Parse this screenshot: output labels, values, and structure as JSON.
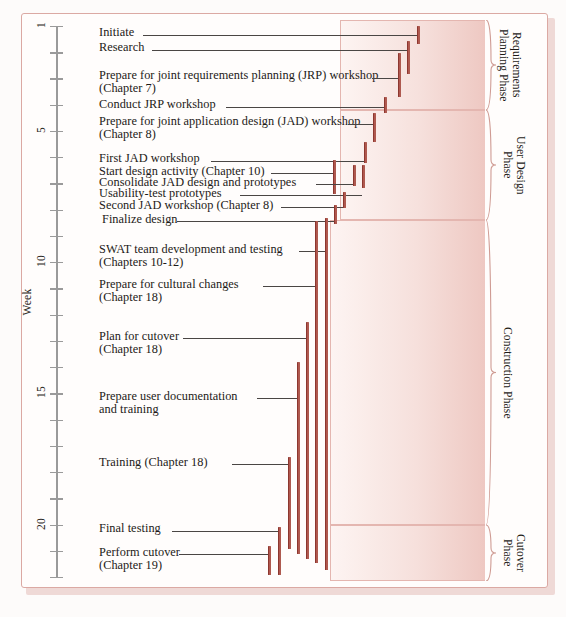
{
  "figure": {
    "axis_title": "Week",
    "axis_ticks": [
      1,
      2,
      3,
      4,
      5,
      6,
      7,
      8,
      9,
      10,
      11,
      12,
      13,
      14,
      15,
      16,
      17,
      18,
      19,
      20,
      21,
      22
    ],
    "axis_labeled_ticks": [
      1,
      5,
      10,
      15,
      20
    ],
    "colors": {
      "bar": "#8c352c",
      "frame_border": "#dba9a3",
      "phase_fill": "#f2d5d0",
      "axis": "#9a9a9a",
      "leader": "#4a4644",
      "text": "#1d1a17"
    }
  },
  "chart_data": {
    "type": "bar",
    "title": "",
    "xlabel": "",
    "ylabel": "Week",
    "ylim": [
      1,
      22
    ],
    "orientation": "vertical-duration-bars",
    "categories": [
      "Initiate",
      "Research",
      "Prepare for joint requirements planning (JRP) workshop (Chapter 7)",
      "Conduct JRP workshop",
      "Prepare for joint application design (JAD) workshop (Chapter 8)",
      "First JAD workshop",
      "Start design activity (Chapter 10)",
      "Consolidate JAD design and prototypes",
      "Usability-test prototypes",
      "Second JAD workshop (Chapter 8)",
      "Finalize design",
      "SWAT team development and testing (Chapters 10-12)",
      "Prepare for cultural changes (Chapter 18)",
      "Plan for cutover (Chapter 18)",
      "Prepare user documentation and training",
      "Training (Chapter 18)",
      "Final testing",
      "Perform cutover (Chapter 19)"
    ],
    "tasks": [
      {
        "id": "initiate",
        "label_line1": "Initiate",
        "label_line2": "",
        "start_week": 1.0,
        "end_week": 1.45,
        "bar_x": 417,
        "bar_top": 26,
        "bar_bottom": 44,
        "label_x": 99,
        "label_y": 26,
        "leader_x1": 143,
        "leader_x2": 417,
        "leader_y": 35
      },
      {
        "id": "research",
        "label_line1": "Research",
        "label_line2": "",
        "start_week": 1.3,
        "end_week": 2.6,
        "bar_x": 407,
        "bar_top": 41,
        "bar_bottom": 74,
        "label_x": 99,
        "label_y": 41,
        "leader_x1": 152,
        "leader_x2": 407,
        "leader_y": 50
      },
      {
        "id": "prepare-jrp",
        "label_line1": "Prepare for joint requirements planning (JRP) workshop",
        "label_line2": "(Chapter 7)",
        "start_week": 1.9,
        "end_week": 3.5,
        "bar_x": 398,
        "bar_top": 53,
        "bar_bottom": 97,
        "label_x": 99,
        "label_y": 69,
        "leader_x1": 372,
        "leader_x2": 398,
        "leader_y": 78
      },
      {
        "id": "conduct-jrp",
        "label_line1": "Conduct JRP workshop",
        "label_line2": "",
        "start_week": 3.5,
        "end_week": 4.1,
        "bar_x": 384,
        "bar_top": 97,
        "bar_bottom": 113,
        "label_x": 99,
        "label_y": 98,
        "leader_x1": 226,
        "leader_x2": 384,
        "leader_y": 107
      },
      {
        "id": "prepare-jad",
        "label_line1": "Prepare for joint application design (JAD) workshop",
        "label_line2": "(Chapter 8)",
        "start_week": 4.0,
        "end_week": 5.1,
        "bar_x": 373,
        "bar_top": 113,
        "bar_bottom": 142,
        "label_x": 99,
        "label_y": 115,
        "leader_x1": 348,
        "leader_x2": 373,
        "leader_y": 124
      },
      {
        "id": "first-jad",
        "label_line1": "First JAD workshop",
        "label_line2": "",
        "start_week": 5.1,
        "end_week": 5.9,
        "bar_x": 364,
        "bar_top": 142,
        "bar_bottom": 163,
        "label_x": 99,
        "label_y": 152,
        "leader_x1": 211,
        "leader_x2": 364,
        "leader_y": 161
      },
      {
        "id": "start-design",
        "label_line1": "Start design activity (Chapter 10)",
        "label_line2": "",
        "start_week": 5.8,
        "end_week": 7.1,
        "bar_x": 333,
        "bar_top": 160,
        "bar_bottom": 194,
        "label_x": 99,
        "label_y": 165,
        "leader_x1": 271,
        "leader_x2": 333,
        "leader_y": 173
      },
      {
        "id": "consolidate-jad",
        "label_line1": "Consolidate JAD design and prototypes",
        "label_line2": "",
        "start_week": 5.9,
        "end_week": 6.6,
        "bar_x": 353,
        "bar_top": 165,
        "bar_bottom": 186,
        "label_x": 99,
        "label_y": 176,
        "leader_x1": 316,
        "leader_x2": 353,
        "leader_y": 184
      },
      {
        "id": "usability-test",
        "label_line1": "Usability-test prototypes",
        "label_line2": "",
        "start_week": 5.9,
        "end_week": 6.7,
        "bar_x": 362,
        "bar_top": 165,
        "bar_bottom": 188,
        "label_x": 99,
        "label_y": 187,
        "leader_x1": 240,
        "leader_x2": 362,
        "leader_y": 195
      },
      {
        "id": "second-jad",
        "label_line1": "Second JAD workshop (Chapter 8)",
        "label_line2": "",
        "start_week": 6.7,
        "end_week": 7.3,
        "bar_x": 343,
        "bar_top": 192,
        "bar_bottom": 208,
        "label_x": 99,
        "label_y": 199,
        "leader_x1": 281,
        "leader_x2": 343,
        "leader_y": 207
      },
      {
        "id": "finalize-design",
        "label_line1": "Finalize design",
        "label_line2": "",
        "start_week": 7.2,
        "end_week": 7.9,
        "bar_x": 334,
        "bar_top": 205,
        "bar_bottom": 224,
        "label_x": 102,
        "label_y": 213,
        "leader_x1": 177,
        "leader_x2": 334,
        "leader_y": 221
      },
      {
        "id": "swat-team",
        "label_line1": "SWAT team development and testing",
        "label_line2": "(Chapters 10-12)",
        "start_week": 7.6,
        "end_week": 21.0,
        "bar_x": 325,
        "bar_top": 218,
        "bar_bottom": 570,
        "label_x": 99,
        "label_y": 243,
        "leader_x1": 299,
        "leader_x2": 325,
        "leader_y": 251
      },
      {
        "id": "cultural-changes",
        "label_line1": "Prepare for cultural changes",
        "label_line2": "(Chapter 18)",
        "start_week": 7.8,
        "end_week": 20.8,
        "bar_x": 315,
        "bar_top": 221,
        "bar_bottom": 563,
        "label_x": 99,
        "label_y": 278,
        "leader_x1": 263,
        "leader_x2": 315,
        "leader_y": 286
      },
      {
        "id": "plan-cutover",
        "label_line1": "Plan for cutover",
        "label_line2": "(Chapter 18)",
        "start_week": 11.6,
        "end_week": 20.7,
        "bar_x": 306,
        "bar_top": 322,
        "bar_bottom": 559,
        "label_x": 99,
        "label_y": 330,
        "leader_x1": 183,
        "leader_x2": 306,
        "leader_y": 338
      },
      {
        "id": "user-documentation",
        "label_line1": "Prepare user documentation",
        "label_line2": "and training",
        "start_week": 13.2,
        "end_week": 20.5,
        "bar_x": 297,
        "bar_top": 362,
        "bar_bottom": 554,
        "label_x": 99,
        "label_y": 390,
        "leader_x1": 257,
        "leader_x2": 297,
        "leader_y": 398
      },
      {
        "id": "training",
        "label_line1": "Training (Chapter 18)",
        "label_line2": "",
        "start_week": 17.1,
        "end_week": 20.4,
        "bar_x": 288,
        "bar_top": 457,
        "bar_bottom": 549,
        "label_x": 99,
        "label_y": 456,
        "leader_x1": 232,
        "leader_x2": 288,
        "leader_y": 464
      },
      {
        "id": "final-testing",
        "label_line1": "Final testing",
        "label_line2": "",
        "start_week": 19.9,
        "end_week": 22.0,
        "bar_x": 278,
        "bar_top": 527,
        "bar_bottom": 575,
        "label_x": 99,
        "label_y": 522,
        "leader_x1": 172,
        "leader_x2": 278,
        "leader_y": 531
      },
      {
        "id": "perform-cutover",
        "label_line1": "Perform cutover",
        "label_line2": "(Chapter 19)",
        "start_week": 20.5,
        "end_week": 22.0,
        "bar_x": 268,
        "bar_top": 546,
        "bar_bottom": 575,
        "label_x": 99,
        "label_y": 546,
        "leader_x1": 179,
        "leader_x2": 268,
        "leader_y": 554
      }
    ]
  },
  "phases": [
    {
      "id": "requirements-planning",
      "line1": "Requirements",
      "line2": "Planning Phase",
      "top": 20,
      "height": 90,
      "left": 340,
      "label_left": 497
    },
    {
      "id": "user-design",
      "line1": "User Design",
      "line2": "Phase",
      "top": 110,
      "height": 110,
      "left": 340,
      "label_left": 501
    },
    {
      "id": "construction",
      "line1": "Construction Phase",
      "line2": "",
      "top": 220,
      "height": 305,
      "left": 330,
      "label_left": 501
    },
    {
      "id": "cutover",
      "line1": "Cutover",
      "line2": "Phase",
      "top": 525,
      "height": 56,
      "left": 330,
      "label_left": 501
    }
  ]
}
